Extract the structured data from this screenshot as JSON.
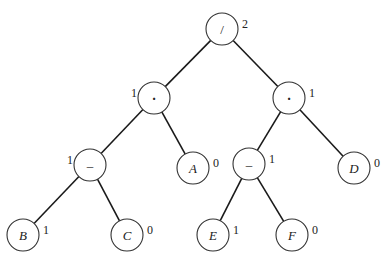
{
  "diagram": {
    "type": "expression-tree",
    "node_radius": 16,
    "nodes": [
      {
        "id": "root",
        "label": "/",
        "kind": "op",
        "x": 222,
        "y": 29,
        "number": "2",
        "number_side": "right"
      },
      {
        "id": "mulL",
        "label": "*",
        "kind": "op",
        "x": 154,
        "y": 98,
        "number": "1",
        "number_side": "left"
      },
      {
        "id": "mulR",
        "label": "*",
        "kind": "op",
        "x": 289,
        "y": 98,
        "number": "1",
        "number_side": "right"
      },
      {
        "id": "subL",
        "label": "–",
        "kind": "op",
        "x": 90,
        "y": 165,
        "number": "1",
        "number_side": "left"
      },
      {
        "id": "A",
        "label": "A",
        "kind": "var",
        "x": 193,
        "y": 168,
        "number": "0",
        "number_side": "right"
      },
      {
        "id": "subR",
        "label": "–",
        "kind": "op",
        "x": 249,
        "y": 164,
        "number": "1",
        "number_side": "right"
      },
      {
        "id": "D",
        "label": "D",
        "kind": "var",
        "x": 354,
        "y": 168,
        "number": "0",
        "number_side": "right"
      },
      {
        "id": "B",
        "label": "B",
        "kind": "var",
        "x": 23,
        "y": 235,
        "number": "1",
        "number_side": "right"
      },
      {
        "id": "C",
        "label": "C",
        "kind": "var",
        "x": 127,
        "y": 235,
        "number": "0",
        "number_side": "right"
      },
      {
        "id": "E",
        "label": "E",
        "kind": "var",
        "x": 213,
        "y": 235,
        "number": "1",
        "number_side": "right"
      },
      {
        "id": "F",
        "label": "F",
        "kind": "var",
        "x": 292,
        "y": 235,
        "number": "0",
        "number_side": "right"
      }
    ],
    "edges": [
      [
        "root",
        "mulL"
      ],
      [
        "root",
        "mulR"
      ],
      [
        "mulL",
        "subL"
      ],
      [
        "mulL",
        "A"
      ],
      [
        "mulR",
        "subR"
      ],
      [
        "mulR",
        "D"
      ],
      [
        "subL",
        "B"
      ],
      [
        "subL",
        "C"
      ],
      [
        "subR",
        "E"
      ],
      [
        "subR",
        "F"
      ]
    ],
    "colors": {
      "line": "#1a1a1a",
      "circle_stroke": "#333333",
      "background": "#ffffff"
    }
  }
}
